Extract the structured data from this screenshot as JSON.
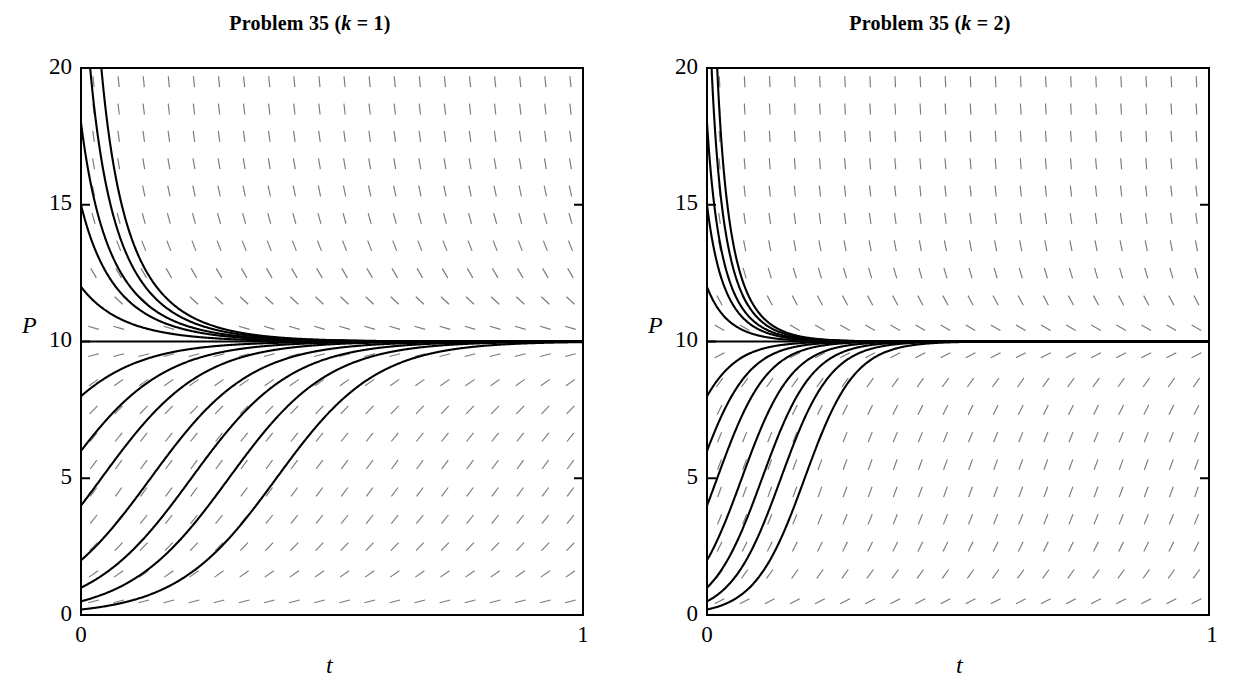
{
  "figure": {
    "kind": "direction-field-with-solution-curves",
    "background": "#ffffff",
    "curve_color": "#000000",
    "field_color": "#555555"
  },
  "panels": [
    {
      "id": "left",
      "title_prefix": "Problem 35 (",
      "title_var": "k",
      "title_eq": " = 1",
      "title_suffix": ")",
      "title_full": "Problem 35 (k = 1)",
      "k": 1,
      "xlabel": "t",
      "ylabel": "P",
      "xticks": [
        "0",
        "1"
      ],
      "yticks": [
        "0",
        "5",
        "10",
        "15",
        "20"
      ]
    },
    {
      "id": "right",
      "title_prefix": "Problem 35 (",
      "title_var": "k",
      "title_eq": " = 2",
      "title_suffix": ")",
      "title_full": "Problem 35 (k = 2)",
      "k": 2,
      "xlabel": "t",
      "ylabel": "P",
      "xticks": [
        "0",
        "1"
      ],
      "yticks": [
        "0",
        "5",
        "10",
        "15",
        "20"
      ]
    }
  ],
  "chart_data": {
    "type": "line",
    "xlabel": "t",
    "ylabel": "P",
    "xlim": [
      0,
      1
    ],
    "ylim": [
      0,
      20
    ],
    "xticks": [
      0,
      1
    ],
    "yticks": [
      0,
      5,
      10,
      15,
      20
    ],
    "grid": false,
    "legend": "none",
    "equilibrium_lines": [
      0,
      10
    ],
    "model": "dP/dt = k*P*(10 - P)",
    "carrying_capacity": 10,
    "series": [
      {
        "name": "k = 1 solution curves",
        "k": 1,
        "initial_conditions": [
          0.2,
          0.5,
          1.0,
          2.0,
          4.0,
          6.0,
          8.0,
          12.0,
          15.0,
          18.0,
          25.0,
          40.0
        ],
        "description": "logistic solutions P(t) = 10*P0 / (P0 + (10-P0)*exp(-10*k*t)) approaching P = 10"
      },
      {
        "name": "k = 2 solution curves",
        "k": 2,
        "initial_conditions": [
          0.2,
          0.5,
          1.0,
          2.0,
          4.0,
          6.0,
          8.0,
          12.0,
          15.0,
          18.0,
          25.0,
          40.0
        ],
        "description": "logistic solutions P(t) = 10*P0 / (P0 + (10-P0)*exp(-10*k*t)) approaching P = 10, steeper than k = 1"
      }
    ],
    "direction_field": {
      "shown": true,
      "nx": 20,
      "ny": 20,
      "slope_formula": "dP/dt = k*P*(10 - P)"
    }
  }
}
